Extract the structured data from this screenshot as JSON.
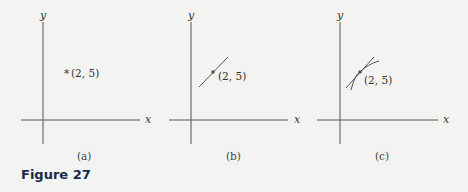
{
  "figure": {
    "caption": "Figure 27",
    "point_label": "(2, 5)",
    "axis_x_label": "x",
    "axis_y_label": "y",
    "panels": [
      {
        "id": "a",
        "sublabel": "(a)",
        "description": "Point (2, 5) alone"
      },
      {
        "id": "b",
        "sublabel": "(b)",
        "description": "A straight line through (2, 5)"
      },
      {
        "id": "c",
        "sublabel": "(c)",
        "description": "A curve and its tangent line through (2, 5)"
      }
    ]
  },
  "colors": {
    "background": "#f3f3f2",
    "axis": "#555555",
    "curve": "#555555",
    "caption": "#1a2a4a"
  }
}
